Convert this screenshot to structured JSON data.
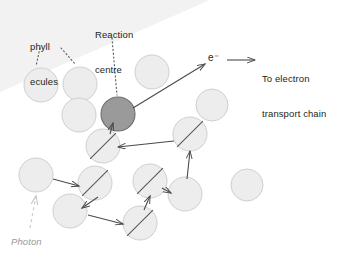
{
  "figure": {
    "width": 343,
    "height": 260,
    "background": "#ffffff"
  },
  "colors": {
    "antenna_fill": "#ededed",
    "antenna_stroke": "#cfcfcf",
    "reaction_centre_fill": "#9a9a9a",
    "reaction_centre_stroke": "#6e6e6e",
    "arrow": "#4a4a4a",
    "leader": "#5a5a5a",
    "photon_arrow": "#cccccc",
    "text": "#231f20",
    "photon_text": "#9a9a9a",
    "corner_wedge": "#f2f2f2"
  },
  "labels": {
    "chlorophyll": {
      "line1": "phyll",
      "line2": "ecules",
      "full_text": "Chlorophyll molecules",
      "x": 30,
      "y": 18
    },
    "reaction_centre": {
      "line1": "Reaction",
      "line2": "centre",
      "x": 95,
      "y": 6
    },
    "electron": {
      "text": "e⁻",
      "x": 208,
      "y": 52
    },
    "electron_transport": {
      "line1": "To electron",
      "line2": "transport chain",
      "x": 262,
      "y": 50
    },
    "photon": {
      "text": "Photon",
      "x": 11,
      "y": 236
    }
  },
  "circles": [
    {
      "id": "c1",
      "name": "antenna-pigment",
      "cx": 41,
      "cy": 85,
      "r": 17,
      "type": "antenna",
      "excited": false
    },
    {
      "id": "c2",
      "name": "antenna-pigment",
      "cx": 80,
      "cy": 84,
      "r": 17,
      "type": "antenna",
      "excited": false
    },
    {
      "id": "c3",
      "name": "antenna-pigment",
      "cx": 79,
      "cy": 115,
      "r": 17,
      "type": "antenna",
      "excited": false
    },
    {
      "id": "c4",
      "name": "antenna-pigment",
      "cx": 152,
      "cy": 72,
      "r": 17,
      "type": "antenna",
      "excited": false
    },
    {
      "id": "c5",
      "name": "reaction-centre",
      "cx": 118,
      "cy": 114,
      "r": 17,
      "type": "reaction_centre",
      "excited": false
    },
    {
      "id": "c6",
      "name": "antenna-pigment",
      "cx": 212,
      "cy": 105,
      "r": 16,
      "type": "antenna",
      "excited": false
    },
    {
      "id": "c7",
      "name": "antenna-pigment",
      "cx": 103,
      "cy": 146,
      "r": 17,
      "type": "antenna",
      "excited": true
    },
    {
      "id": "c8",
      "name": "antenna-pigment",
      "cx": 190,
      "cy": 134,
      "r": 17,
      "type": "antenna",
      "excited": true
    },
    {
      "id": "c9",
      "name": "antenna-pigment",
      "cx": 36,
      "cy": 175,
      "r": 17,
      "type": "antenna",
      "excited": false
    },
    {
      "id": "c10",
      "name": "antenna-pigment",
      "cx": 95,
      "cy": 183,
      "r": 17,
      "type": "antenna",
      "excited": true
    },
    {
      "id": "c11",
      "name": "antenna-pigment",
      "cx": 70,
      "cy": 211,
      "r": 17,
      "type": "antenna",
      "excited": false
    },
    {
      "id": "c12",
      "name": "antenna-pigment",
      "cx": 140,
      "cy": 223,
      "r": 17,
      "type": "antenna",
      "excited": true
    },
    {
      "id": "c13",
      "name": "antenna-pigment",
      "cx": 150,
      "cy": 181,
      "r": 17,
      "type": "antenna",
      "excited": true
    },
    {
      "id": "c14",
      "name": "antenna-pigment",
      "cx": 185,
      "cy": 194,
      "r": 17,
      "type": "antenna",
      "excited": false
    },
    {
      "id": "c15",
      "name": "antenna-pigment",
      "cx": 247,
      "cy": 185,
      "r": 16,
      "type": "antenna",
      "excited": false
    }
  ],
  "energy_transfer_arrows": [
    {
      "from": "c9",
      "to": "c10",
      "x1": 53,
      "y1": 179,
      "x2": 79,
      "y2": 186
    },
    {
      "from": "c10",
      "to": "c11",
      "x1": 98,
      "y1": 197,
      "x2": 82,
      "y2": 208
    },
    {
      "from": "c11",
      "to": "c12",
      "x1": 88,
      "y1": 215,
      "x2": 123,
      "y2": 224
    },
    {
      "from": "c12",
      "to": "c13",
      "x1": 144,
      "y1": 210,
      "x2": 150,
      "y2": 196
    },
    {
      "from": "c13",
      "to": "c14",
      "x1": 162,
      "y1": 188,
      "x2": 171,
      "y2": 193
    },
    {
      "from": "c14",
      "to": "c8",
      "x1": 187,
      "y1": 179,
      "x2": 190,
      "y2": 151
    },
    {
      "from": "c8",
      "to": "c7",
      "x1": 174,
      "y1": 141,
      "x2": 118,
      "y2": 147
    },
    {
      "from": "c7",
      "to": "c5",
      "x1": 110,
      "y1": 134,
      "x2": 113,
      "y2": 123
    }
  ],
  "electron_arrow": {
    "label": "e⁻",
    "x1": 133,
    "y1": 108,
    "x2": 205,
    "y2": 64,
    "tail_x": 227,
    "tail_y": 60,
    "head_x": 255,
    "head_y": 60
  },
  "photon_arrow": {
    "label": "Photon",
    "x1": 30,
    "y1": 228,
    "x2": 36,
    "y2": 196,
    "style": "dashed"
  },
  "leader_lines": [
    {
      "name": "chlorophyll-leader-left",
      "x1": 40,
      "y1": 48,
      "x2": 36,
      "y2": 66,
      "style": "dotted"
    },
    {
      "name": "chlorophyll-leader-right",
      "x1": 61,
      "y1": 48,
      "x2": 76,
      "y2": 65,
      "style": "dotted"
    },
    {
      "name": "reaction-centre-leader",
      "x1": 112,
      "y1": 38,
      "x2": 117,
      "y2": 95,
      "style": "dotted"
    }
  ]
}
